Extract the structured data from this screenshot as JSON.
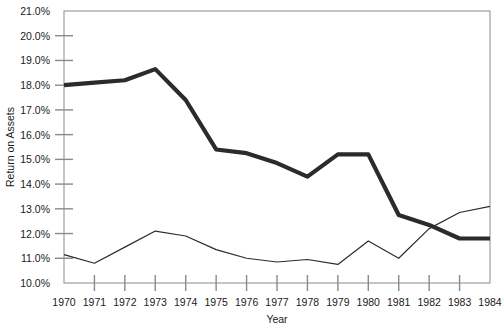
{
  "chart_data": {
    "type": "line",
    "title": "",
    "xlabel": "Year",
    "ylabel": "Return on Assets",
    "x": [
      1970,
      1971,
      1972,
      1973,
      1974,
      1975,
      1976,
      1977,
      1978,
      1979,
      1980,
      1981,
      1982,
      1983,
      1984
    ],
    "categories": [
      "1970",
      "1971",
      "1972",
      "1973",
      "1974",
      "1975",
      "1976",
      "1977",
      "1978",
      "1979",
      "1980",
      "1981",
      "1982",
      "1983",
      "1984"
    ],
    "xlim": [
      1970,
      1984
    ],
    "ylim": [
      10.0,
      21.0
    ],
    "ytick_labels": [
      "21.0%",
      "20.0%",
      "19.0%",
      "18.0%",
      "17.0%",
      "16.0%",
      "15.0%",
      "14.0%",
      "13.0%",
      "12.0%",
      "11.0%",
      "10.0%"
    ],
    "ytick_values": [
      21.0,
      20.0,
      19.0,
      18.0,
      17.0,
      16.0,
      15.0,
      14.0,
      13.0,
      12.0,
      11.0,
      10.0
    ],
    "grid": false,
    "legend": "none",
    "series": [
      {
        "name": "thick-series",
        "style": "thick",
        "color": "#2b2b2b",
        "line_width": 4.2,
        "values": [
          18.0,
          18.1,
          18.2,
          18.65,
          17.4,
          15.4,
          15.25,
          14.85,
          14.3,
          15.2,
          15.2,
          12.75,
          12.35,
          11.8,
          11.8
        ]
      },
      {
        "name": "thin-series",
        "style": "thin",
        "color": "#2b2b2b",
        "line_width": 1.2,
        "values": [
          11.15,
          10.8,
          11.45,
          12.1,
          11.9,
          11.35,
          11.0,
          10.85,
          10.95,
          10.75,
          11.7,
          11.0,
          12.2,
          12.85,
          13.1
        ]
      }
    ]
  },
  "axes": {
    "x_axis_label": "Year",
    "y_axis_label": "Return on Assets"
  },
  "colors": {
    "line": "#2b2b2b",
    "axis": "#8a8a8a",
    "frame": "#8a8a8a",
    "text": "#1a1a1a",
    "background": "#ffffff"
  }
}
